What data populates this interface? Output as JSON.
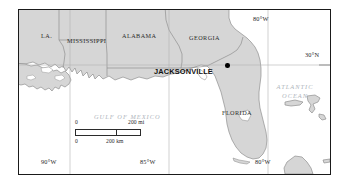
{
  "figure": {
    "kind": "reference-map",
    "title_visible": false,
    "background_color": "#ffffff",
    "frame_color": "#1a1a1a",
    "land_fill": "#d6d6d6",
    "land_stroke": "#8a8a8a",
    "water_fill": "#ffffff",
    "lake_fill": "#ffffff",
    "graticule_color": "#b0b0b0",
    "city_dot_color": "#000000"
  },
  "state_labels": [
    {
      "id": "la",
      "text": "LA.",
      "x": 22,
      "y": 23
    },
    {
      "id": "mississippi",
      "text": "MISSISSIPPI",
      "x": 50,
      "y": 28
    },
    {
      "id": "alabama",
      "text": "ALABAMA",
      "x": 105,
      "y": 23
    },
    {
      "id": "georgia",
      "text": "GEORGIA",
      "x": 172,
      "y": 25
    },
    {
      "id": "florida",
      "text": "FLORIDA",
      "x": 204,
      "y": 101
    }
  ],
  "water_labels": [
    {
      "id": "gulf-of-mexico",
      "text": "GULF OF MEXICO",
      "x": 94,
      "y": 105
    },
    {
      "id": "atlantic-ocean",
      "line1": "ATLANTIC",
      "line2": "OCEAN",
      "x": 276,
      "y": 73
    }
  ],
  "city": {
    "name": "JACKSONVILLE",
    "label_x": 152,
    "label_y": 62,
    "dot_x": 226,
    "dot_y": 58
  },
  "graticule": {
    "meridians": [
      {
        "id": "90w",
        "label": "90°W",
        "x": 51,
        "label_x": 40,
        "label_y": 165
      },
      {
        "id": "85w",
        "label": "85°W",
        "x": 150,
        "label_x": 139,
        "label_y": 165
      },
      {
        "id": "80w-top",
        "label": "80°W",
        "x": 249,
        "label_x": 252,
        "label_y": 15
      },
      {
        "id": "80w-bottom",
        "label": "80°W",
        "x": 249,
        "label_x": 252,
        "label_y": 165
      }
    ],
    "parallels": [
      {
        "id": "30n",
        "label": "30°N",
        "y": 55,
        "label_x": 306,
        "label_y": 52
      }
    ]
  },
  "scale_bar": {
    "miles": {
      "zero": "0",
      "max": "200 mi"
    },
    "kilometers": {
      "zero": "0",
      "max": "200 km"
    },
    "x": 56,
    "y": 131,
    "mi_width": 66,
    "km_width": 41,
    "bar_height": 6
  }
}
